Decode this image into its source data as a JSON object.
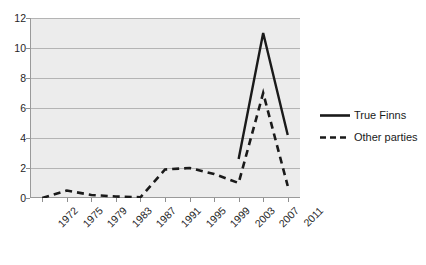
{
  "chart_data": {
    "type": "line",
    "title": "",
    "xlabel": "",
    "ylabel": "",
    "categories": [
      "1972",
      "1975",
      "1979",
      "1983",
      "1987",
      "1991",
      "1995",
      "1999",
      "2003",
      "2007",
      "2011"
    ],
    "ylim": [
      0,
      12
    ],
    "yticks": [
      0,
      2,
      4,
      6,
      8,
      10,
      12
    ],
    "grid": true,
    "legend_position": "right",
    "series": [
      {
        "name": "True Finns",
        "style": "solid",
        "color": "#1a1a1a",
        "values": [
          null,
          null,
          null,
          null,
          null,
          null,
          null,
          null,
          2.6,
          11.0,
          4.2
        ]
      },
      {
        "name": "Other parties",
        "style": "dashed",
        "color": "#1a1a1a",
        "values": [
          0.0,
          0.5,
          0.2,
          0.1,
          0.05,
          1.9,
          2.0,
          1.6,
          1.0,
          7.0,
          0.8
        ]
      }
    ]
  },
  "axes": {
    "y_labels": [
      "12",
      "10",
      "8",
      "6",
      "4",
      "2",
      "0"
    ],
    "x_labels": [
      "1972",
      "1975",
      "1979",
      "1983",
      "1987",
      "1991",
      "1995",
      "1999",
      "2003",
      "2007",
      "2011"
    ]
  },
  "legend": {
    "items": [
      {
        "label": "True Finns",
        "style": "solid"
      },
      {
        "label": "Other parties",
        "style": "dashed"
      }
    ]
  },
  "colors": {
    "plot_background": "#ececec",
    "gridline": "#b4b4b4",
    "axis": "#9a9a9a",
    "series": "#1a1a1a",
    "text": "#262626"
  }
}
